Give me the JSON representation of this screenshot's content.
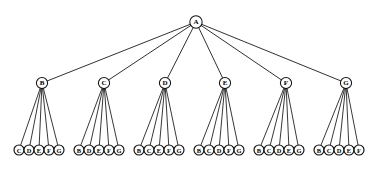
{
  "diagram": {
    "type": "tree",
    "background_color": "#ffffff",
    "line_color": "#111111",
    "node_fill": "#ffffff",
    "canvas": {
      "width": 387,
      "height": 170
    },
    "levels": 3,
    "root": {
      "label": "A",
      "x": 196,
      "y": 22,
      "r": 6.2
    },
    "level2": {
      "y": 83,
      "r": 5.6,
      "nodes": [
        {
          "label": "B",
          "x": 42
        },
        {
          "label": "C",
          "x": 104
        },
        {
          "label": "D",
          "x": 165
        },
        {
          "label": "E",
          "x": 225
        },
        {
          "label": "F",
          "x": 286
        },
        {
          "label": "G",
          "x": 346
        }
      ]
    },
    "leaves": {
      "y": 150,
      "r": 5.0,
      "spacing": 10.0,
      "groups": [
        {
          "parent": "B",
          "start_x": 19,
          "labels": [
            "C",
            "D",
            "E",
            "F",
            "G"
          ]
        },
        {
          "parent": "C",
          "start_x": 79,
          "labels": [
            "B",
            "D",
            "E",
            "F",
            "G"
          ]
        },
        {
          "parent": "D",
          "start_x": 139,
          "labels": [
            "B",
            "C",
            "E",
            "F",
            "G"
          ]
        },
        {
          "parent": "E",
          "start_x": 199,
          "labels": [
            "B",
            "C",
            "D",
            "F",
            "G"
          ]
        },
        {
          "parent": "F",
          "start_x": 259,
          "labels": [
            "B",
            "C",
            "D",
            "E",
            "G"
          ]
        },
        {
          "parent": "G",
          "start_x": 319,
          "labels": [
            "B",
            "C",
            "D",
            "E",
            "F"
          ]
        }
      ]
    }
  }
}
